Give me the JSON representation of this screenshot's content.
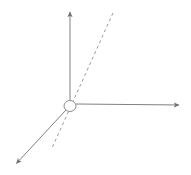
{
  "figure": {
    "title": "",
    "background_color": "#ffffff",
    "width": 191,
    "height": 175,
    "stroke_color": "#808080",
    "dash_color": "#9a9a9a",
    "origin_marker_color": "#8c8c8c",
    "stroke_width": 1
  },
  "chart_data": {
    "type": "diagram",
    "subtype": "3d-axis-triad",
    "title": "",
    "xlabel": "",
    "ylabel": "",
    "origin": {
      "x": 70,
      "y": 106
    },
    "origin_marker": {
      "shape": "ellipse",
      "rx": 6,
      "ry": 5.5,
      "filled": false
    },
    "axes": [
      {
        "name": "vertical-axis",
        "style": "solid",
        "arrow": "end",
        "from": {
          "x": 70,
          "y": 101
        },
        "to": {
          "x": 70,
          "y": 10
        }
      },
      {
        "name": "horizontal-axis",
        "style": "solid",
        "arrow": "end",
        "from": {
          "x": 76,
          "y": 104
        },
        "to": {
          "x": 181,
          "y": 105
        }
      },
      {
        "name": "depth-axis",
        "style": "solid",
        "arrow": "end",
        "from": {
          "x": 66,
          "y": 110
        },
        "to": {
          "x": 15,
          "y": 165
        }
      }
    ],
    "lines": [
      {
        "name": "dashed-line",
        "style": "dashed",
        "arrow": "none",
        "dash_pattern": [
          3,
          3
        ],
        "from": {
          "x": 113,
          "y": 13
        },
        "to": {
          "x": 52,
          "y": 148
        }
      }
    ],
    "legend": [],
    "annotations": []
  }
}
